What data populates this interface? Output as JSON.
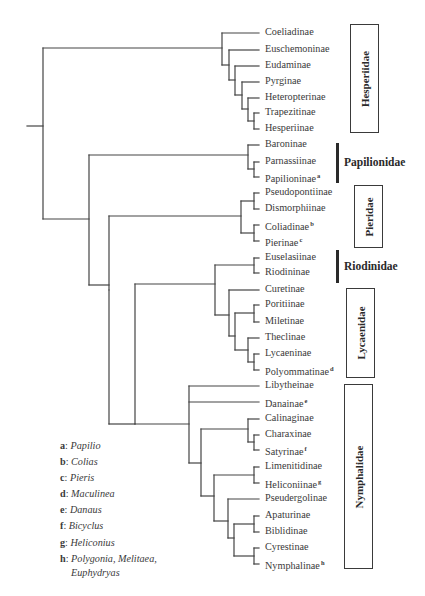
{
  "diagram": {
    "type": "phylogenetic-tree",
    "leaves": [
      {
        "id": "coeliadinae",
        "label": "Coeliadinae",
        "sup": "",
        "y": 33
      },
      {
        "id": "euschemoninae",
        "label": "Euschemoninae",
        "sup": "",
        "y": 50
      },
      {
        "id": "eudaminae",
        "label": "Eudaminae",
        "sup": "",
        "y": 66
      },
      {
        "id": "pyrginae",
        "label": "Pyrginae",
        "sup": "",
        "y": 82
      },
      {
        "id": "heteropterinae",
        "label": "Heteropterinae",
        "sup": "",
        "y": 98
      },
      {
        "id": "trapezitinae",
        "label": "Trapezitinae",
        "sup": "",
        "y": 113
      },
      {
        "id": "hesperiinae",
        "label": "Hesperiinae",
        "sup": "",
        "y": 129
      },
      {
        "id": "baroninae",
        "label": "Baroninae",
        "sup": "",
        "y": 145
      },
      {
        "id": "parnassiinae",
        "label": "Parnassiinae",
        "sup": "",
        "y": 162
      },
      {
        "id": "papilioninae",
        "label": "Papilioninae",
        "sup": "a",
        "y": 177
      },
      {
        "id": "pseudopontiinae",
        "label": "Pseudopontiinae",
        "sup": "",
        "y": 193
      },
      {
        "id": "dismorphiinae",
        "label": "Dismorphiinae",
        "sup": "",
        "y": 209
      },
      {
        "id": "coliadinae",
        "label": "Coliadinae",
        "sup": "b",
        "y": 225
      },
      {
        "id": "pierinae",
        "label": "Pierinae",
        "sup": "c",
        "y": 241
      },
      {
        "id": "euselasiinae",
        "label": "Euselasiinae",
        "sup": "",
        "y": 258
      },
      {
        "id": "riodininae",
        "label": "Riodininae",
        "sup": "",
        "y": 273
      },
      {
        "id": "curetinae",
        "label": "Curetinae",
        "sup": "",
        "y": 290
      },
      {
        "id": "poritiinae",
        "label": "Poritiinae",
        "sup": "",
        "y": 305
      },
      {
        "id": "miletinae",
        "label": "Miletinae",
        "sup": "",
        "y": 322
      },
      {
        "id": "theclinae",
        "label": "Theclinae",
        "sup": "",
        "y": 338
      },
      {
        "id": "lycaeninae",
        "label": "Lycaeninae",
        "sup": "",
        "y": 354
      },
      {
        "id": "polyommatinae",
        "label": "Polyommatinae",
        "sup": "d",
        "y": 370
      },
      {
        "id": "libytheinae",
        "label": "Libytheinae",
        "sup": "",
        "y": 386
      },
      {
        "id": "danainae",
        "label": "Danainae",
        "sup": "e",
        "y": 402
      },
      {
        "id": "calinaginae",
        "label": "Calinaginae",
        "sup": "",
        "y": 419
      },
      {
        "id": "charaxinae",
        "label": "Charaxinae",
        "sup": "",
        "y": 435
      },
      {
        "id": "satyrinae",
        "label": "Satyrinae",
        "sup": "f",
        "y": 450
      },
      {
        "id": "limenitidinae",
        "label": "Limenitidinae",
        "sup": "",
        "y": 467
      },
      {
        "id": "heliconiinae",
        "label": "Heliconiinae",
        "sup": "g",
        "y": 483
      },
      {
        "id": "pseudergolinae",
        "label": "Pseudergolinae",
        "sup": "",
        "y": 499
      },
      {
        "id": "apaturinae",
        "label": "Apaturinae",
        "sup": "",
        "y": 516
      },
      {
        "id": "biblidinae",
        "label": "Biblidinae",
        "sup": "",
        "y": 532
      },
      {
        "id": "cyrestinae",
        "label": "Cyrestinae",
        "sup": "",
        "y": 548
      },
      {
        "id": "nymphalinae",
        "label": "Nymphalinae",
        "sup": "h",
        "y": 564
      }
    ],
    "families": [
      {
        "name": "Hesperiidae",
        "style": "box",
        "x": 350,
        "y": 24,
        "w": 29,
        "h": 109
      },
      {
        "name": "Papilionidae",
        "style": "bar",
        "x": 336,
        "y": 143,
        "h": 40,
        "text_x": 344
      },
      {
        "name": "Pieridae",
        "style": "box",
        "x": 354,
        "y": 185,
        "w": 29,
        "h": 63
      },
      {
        "name": "Riodinidae",
        "style": "bar",
        "x": 336,
        "y": 250,
        "h": 33,
        "text_x": 344
      },
      {
        "name": "Lycaenidae",
        "style": "box",
        "x": 346,
        "y": 288,
        "w": 29,
        "h": 90
      },
      {
        "name": "Nymphalidae",
        "style": "box",
        "x": 344,
        "y": 384,
        "w": 29,
        "h": 185
      }
    ],
    "legend": [
      {
        "key": "a",
        "genus": "Papilio"
      },
      {
        "key": "b",
        "genus": "Colias"
      },
      {
        "key": "c",
        "genus": "Pieris"
      },
      {
        "key": "d",
        "genus": "Maculinea"
      },
      {
        "key": "e",
        "genus": "Danaus"
      },
      {
        "key": "f",
        "genus": "Bicyclus"
      },
      {
        "key": "g",
        "genus": "Heliconius"
      },
      {
        "key": "h",
        "genus": "Polygonia, Melitaea,",
        "cont": "Euphydryas"
      }
    ],
    "colors": {
      "line": "#3a3a3a",
      "text": "#3a3a3a",
      "background": "#ffffff"
    }
  }
}
